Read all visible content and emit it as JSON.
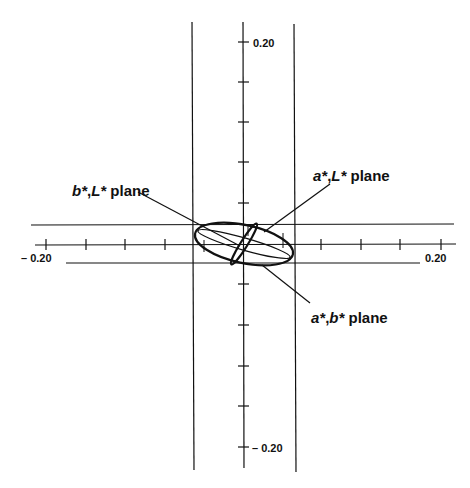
{
  "diagram": {
    "tick_labels": {
      "top": "0.20",
      "bottom": "– 0.20",
      "left": "– 0.20",
      "right": "0.20"
    },
    "labels": {
      "bL": {
        "var1": "b*",
        "sep": ",",
        "var2": "L*",
        "word": " plane"
      },
      "aL": {
        "var1": "a*",
        "sep": ",",
        "var2": "L*",
        "word": " plane"
      },
      "ab": {
        "var1": "a*",
        "sep": ",",
        "var2": "b*",
        "word": " plane"
      }
    },
    "stroke_color": "#111111",
    "background": "#ffffff"
  }
}
